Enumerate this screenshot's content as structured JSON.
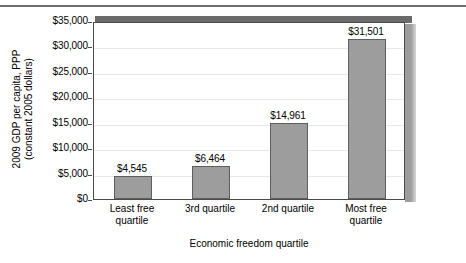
{
  "chart_data": {
    "type": "bar",
    "title": "",
    "subtitle": "",
    "xlabel": "Economic freedom quartile",
    "ylabel": "2009 GDP per capita, PPP (constant 2005 dollars)",
    "ylabel_lines": [
      "2009 GDP per capita, PPP",
      "(constant 2005 dollars)"
    ],
    "categories": [
      "Least free quartile",
      "3rd quartile",
      "2nd quartile",
      "Most free quartile"
    ],
    "category_lines": [
      [
        "Least free",
        "quartile"
      ],
      [
        "3rd quartile"
      ],
      [
        "2nd quartile"
      ],
      [
        "Most free",
        "quartile"
      ]
    ],
    "values": [
      4545,
      6464,
      14961,
      31501
    ],
    "data_labels": [
      "$4,545",
      "$6,464",
      "$14,961",
      "$31,501"
    ],
    "ylim": [
      0,
      35000
    ],
    "ytick_values": [
      0,
      5000,
      10000,
      15000,
      20000,
      25000,
      30000,
      35000
    ],
    "ytick_labels": [
      "$0",
      "$5,000",
      "$10,000",
      "$15,000",
      "$20,000",
      "$25,000",
      "$30,000",
      "$35,000"
    ],
    "grid": true,
    "grid_axis": "y",
    "legend": false,
    "legend_position": "none",
    "bar_color": "#9d9d9d",
    "bar_edge_color": "#5e5e5e",
    "gridline_color": "#e8e8e8",
    "axis_color": "#4a4a4a",
    "shadow_color": "#9c9c9c",
    "top_bar_color": "#6b6b6b",
    "rule_color": "#6d6d6d",
    "background": "#ffffff"
  }
}
